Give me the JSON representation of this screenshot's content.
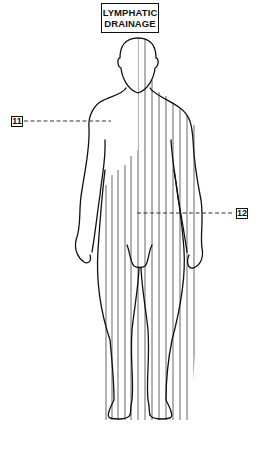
{
  "title": {
    "line1": "LYMPHATIC",
    "line2": "DRAINAGE"
  },
  "labels": [
    {
      "id": "11",
      "text": "11",
      "points_to": "unshaded region (right upper quadrant drainage)"
    },
    {
      "id": "12",
      "text": "12",
      "points_to": "shaded region"
    }
  ],
  "figure": {
    "shading": "vertical line hatching",
    "colors": {
      "outline": "#111111",
      "hatch": "#555555",
      "background": "#ffffff"
    }
  }
}
